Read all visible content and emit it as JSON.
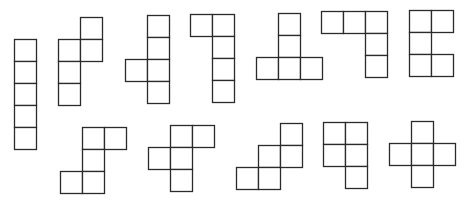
{
  "diagram": {
    "title": "",
    "cell_size": 22,
    "stroke_color": "#2b2b2b",
    "background": "#ffffff",
    "shapes": [
      {
        "name": "pentomino-I",
        "origin": [
          14,
          39
        ],
        "cells": [
          [
            0,
            0
          ],
          [
            0,
            1
          ],
          [
            0,
            2
          ],
          [
            0,
            3
          ],
          [
            0,
            4
          ]
        ]
      },
      {
        "name": "pentomino-N",
        "origin": [
          58,
          17
        ],
        "cells": [
          [
            1,
            0
          ],
          [
            0,
            1
          ],
          [
            1,
            1
          ],
          [
            0,
            2
          ],
          [
            0,
            3
          ]
        ]
      },
      {
        "name": "pentomino-Y",
        "origin": [
          125,
          15
        ],
        "cells": [
          [
            1,
            0
          ],
          [
            1,
            1
          ],
          [
            0,
            2
          ],
          [
            1,
            2
          ],
          [
            1,
            3
          ]
        ]
      },
      {
        "name": "pentomino-L",
        "origin": [
          190,
          14
        ],
        "cells": [
          [
            0,
            0
          ],
          [
            1,
            0
          ],
          [
            1,
            1
          ],
          [
            1,
            2
          ],
          [
            1,
            3
          ]
        ]
      },
      {
        "name": "pentomino-T",
        "origin": [
          256,
          13
        ],
        "cells": [
          [
            1,
            0
          ],
          [
            1,
            1
          ],
          [
            0,
            2
          ],
          [
            1,
            2
          ],
          [
            2,
            2
          ]
        ]
      },
      {
        "name": "pentomino-V",
        "origin": [
          321,
          11
        ],
        "cells": [
          [
            0,
            0
          ],
          [
            1,
            0
          ],
          [
            2,
            0
          ],
          [
            2,
            1
          ],
          [
            2,
            2
          ]
        ]
      },
      {
        "name": "pentomino-U",
        "origin": [
          409,
          10
        ],
        "cells": [
          [
            0,
            0
          ],
          [
            1,
            0
          ],
          [
            0,
            1
          ],
          [
            0,
            2
          ],
          [
            1,
            2
          ]
        ]
      },
      {
        "name": "pentomino-Z",
        "origin": [
          60,
          127
        ],
        "cells": [
          [
            1,
            0
          ],
          [
            2,
            0
          ],
          [
            1,
            1
          ],
          [
            0,
            2
          ],
          [
            1,
            2
          ]
        ]
      },
      {
        "name": "pentomino-F",
        "origin": [
          148,
          125
        ],
        "cells": [
          [
            1,
            0
          ],
          [
            2,
            0
          ],
          [
            0,
            1
          ],
          [
            1,
            1
          ],
          [
            1,
            2
          ]
        ]
      },
      {
        "name": "pentomino-W",
        "origin": [
          236,
          123
        ],
        "cells": [
          [
            2,
            0
          ],
          [
            1,
            1
          ],
          [
            2,
            1
          ],
          [
            0,
            2
          ],
          [
            1,
            2
          ]
        ]
      },
      {
        "name": "pentomino-P",
        "origin": [
          323,
          122
        ],
        "cells": [
          [
            0,
            0
          ],
          [
            1,
            0
          ],
          [
            0,
            1
          ],
          [
            1,
            1
          ],
          [
            1,
            2
          ]
        ]
      },
      {
        "name": "pentomino-X",
        "origin": [
          389,
          121
        ],
        "cells": [
          [
            1,
            0
          ],
          [
            0,
            1
          ],
          [
            1,
            1
          ],
          [
            2,
            1
          ],
          [
            1,
            2
          ]
        ]
      }
    ]
  }
}
